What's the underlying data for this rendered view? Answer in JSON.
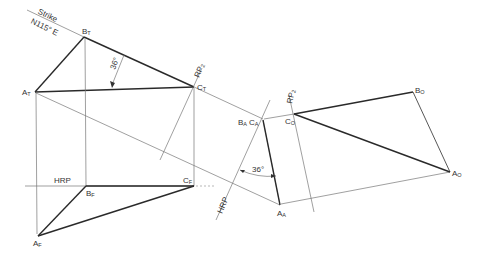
{
  "figure": {
    "strike_label": "Strike",
    "bearing_label": "N115° E",
    "angle_top": "36°",
    "angle_aux": "36°",
    "rp_top": "RP",
    "rp_top_sub": "2",
    "rp_right": "RP",
    "rp_right_sub": "2",
    "hrp_front": "HRP",
    "hrp_aux": "HRP",
    "points": {
      "BT": {
        "main": "B",
        "sub": "T"
      },
      "AT": {
        "main": "A",
        "sub": "T"
      },
      "CT": {
        "main": "C",
        "sub": "T"
      },
      "BF": {
        "main": "B",
        "sub": "F"
      },
      "CF": {
        "main": "C",
        "sub": "F"
      },
      "AF": {
        "main": "A",
        "sub": "F"
      },
      "BA": {
        "main": "B",
        "sub": "A"
      },
      "CA": {
        "main": "C",
        "sub": "A"
      },
      "AA": {
        "main": "A",
        "sub": "A"
      },
      "CO": {
        "main": "C",
        "sub": "O"
      },
      "BO": {
        "main": "B",
        "sub": "O"
      },
      "AO": {
        "main": "A",
        "sub": "O"
      }
    }
  }
}
